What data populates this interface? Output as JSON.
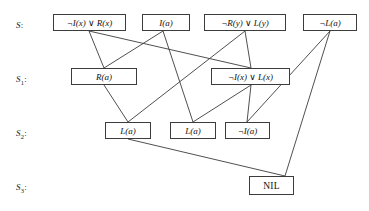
{
  "diagram": {
    "width": 369,
    "height": 211,
    "background": "#ffffff",
    "line_color": "#3c3c3c",
    "box_border_color": "#3c3c3c",
    "text_color": "#111111"
  },
  "rows": [
    {
      "id": "S",
      "label": "S",
      "sub": "",
      "colon": ":",
      "x": 16,
      "y": 20
    },
    {
      "id": "S1",
      "label": "S",
      "sub": "1",
      "colon": ":",
      "x": 16,
      "y": 74
    },
    {
      "id": "S2",
      "label": "S",
      "sub": "2",
      "colon": ":",
      "x": 16,
      "y": 128
    },
    {
      "id": "S3",
      "label": "S",
      "sub": "3",
      "colon": ":",
      "x": 16,
      "y": 182
    }
  ],
  "nodes": [
    {
      "id": "n0",
      "row": "S",
      "text": "¬I(x) ∨ R(x)",
      "x": 53,
      "y": 14,
      "w": 73,
      "h": 17
    },
    {
      "id": "n1",
      "row": "S",
      "text": "I(a)",
      "x": 142,
      "y": 14,
      "w": 48,
      "h": 17
    },
    {
      "id": "n2",
      "row": "S",
      "text": "¬R(y) ∨ L(y)",
      "x": 204,
      "y": 14,
      "w": 82,
      "h": 17
    },
    {
      "id": "n3",
      "row": "S",
      "text": "¬L(a)",
      "x": 303,
      "y": 14,
      "w": 54,
      "h": 17
    },
    {
      "id": "n4",
      "row": "S1",
      "text": "R(a)",
      "x": 71,
      "y": 68,
      "w": 66,
      "h": 17
    },
    {
      "id": "n5",
      "row": "S1",
      "text": "¬I(x) ∨ L(x)",
      "x": 211,
      "y": 68,
      "w": 79,
      "h": 17
    },
    {
      "id": "n6",
      "row": "S2",
      "text": "L(a)",
      "x": 105,
      "y": 122,
      "w": 46,
      "h": 17
    },
    {
      "id": "n7",
      "row": "S2",
      "text": "L(a)",
      "x": 170,
      "y": 122,
      "w": 46,
      "h": 17
    },
    {
      "id": "n8",
      "row": "S2",
      "text": "¬I(a)",
      "x": 225,
      "y": 122,
      "w": 45,
      "h": 17
    },
    {
      "id": "n9",
      "row": "S3",
      "text": "NIL",
      "x": 249,
      "y": 176,
      "w": 45,
      "h": 19
    }
  ],
  "edges": [
    {
      "id": "e0",
      "from": "n0",
      "to": "n4",
      "x1": 89,
      "y1": 31,
      "x2": 104,
      "y2": 68,
      "label": "I-R-to-Ra"
    },
    {
      "id": "e1",
      "from": "n1",
      "to": "n4",
      "x1": 163,
      "y1": 31,
      "x2": 104,
      "y2": 68,
      "label": "Ia-to-Ra"
    },
    {
      "id": "e2",
      "from": "n0",
      "to": "n5",
      "x1": 89,
      "y1": 31,
      "x2": 251,
      "y2": 68,
      "label": "I-R-to-I-L"
    },
    {
      "id": "e3",
      "from": "n2",
      "to": "n5",
      "x1": 245,
      "y1": 31,
      "x2": 251,
      "y2": 68,
      "label": "R-L-to-I-L"
    },
    {
      "id": "e4",
      "from": "n2",
      "to": "n6",
      "x1": 245,
      "y1": 31,
      "x2": 128,
      "y2": 122,
      "label": "R-L-to-La"
    },
    {
      "id": "e5",
      "from": "n4",
      "to": "n6",
      "x1": 104,
      "y1": 85,
      "x2": 128,
      "y2": 122,
      "label": "Ra-to-La"
    },
    {
      "id": "e6",
      "from": "n1",
      "to": "n7",
      "x1": 163,
      "y1": 31,
      "x2": 193,
      "y2": 122,
      "label": "Ia-to-La2"
    },
    {
      "id": "e7",
      "from": "n5",
      "to": "n7",
      "x1": 251,
      "y1": 85,
      "x2": 193,
      "y2": 122,
      "label": "I-L-to-La2"
    },
    {
      "id": "e8",
      "from": "n5",
      "to": "n8",
      "x1": 251,
      "y1": 85,
      "x2": 247,
      "y2": 122,
      "label": "I-L-to-not-Ia"
    },
    {
      "id": "e9",
      "from": "n3",
      "to": "n8",
      "x1": 330,
      "y1": 31,
      "x2": 247,
      "y2": 122,
      "label": "not-La-to-not-Ia"
    },
    {
      "id": "e10",
      "from": "n3",
      "to": "n9",
      "x1": 330,
      "y1": 31,
      "x2": 285,
      "y2": 176,
      "label": "not-La-to-NIL"
    },
    {
      "id": "e11",
      "from": "n6",
      "to": "n9",
      "x1": 128,
      "y1": 139,
      "x2": 285,
      "y2": 176,
      "label": "La-to-NIL"
    }
  ]
}
